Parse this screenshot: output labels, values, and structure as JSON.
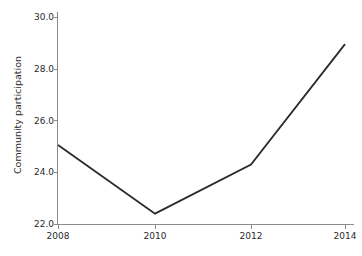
{
  "chart_data": {
    "type": "line",
    "title": "",
    "xlabel": "",
    "ylabel": "Community participation",
    "x": [
      2008,
      2010,
      2012,
      2014
    ],
    "values": [
      25.05,
      22.4,
      24.3,
      28.95
    ],
    "series": [
      {
        "name": "Community participation",
        "values": [
          25.05,
          22.4,
          24.3,
          28.95
        ]
      }
    ],
    "xticks": [
      "2008",
      "2010",
      "2012",
      "2014"
    ],
    "yticks": [
      "22.0",
      "24.0",
      "26.0",
      "28.0",
      "30.0"
    ],
    "xlim": [
      2008,
      2014
    ],
    "ylim": [
      22.0,
      30.0
    ],
    "grid": false,
    "legend": false,
    "legend_position": "none",
    "line_color": "#2a2a2a",
    "background_color": "#ffffff",
    "axis_color": "#8a8a8a"
  }
}
